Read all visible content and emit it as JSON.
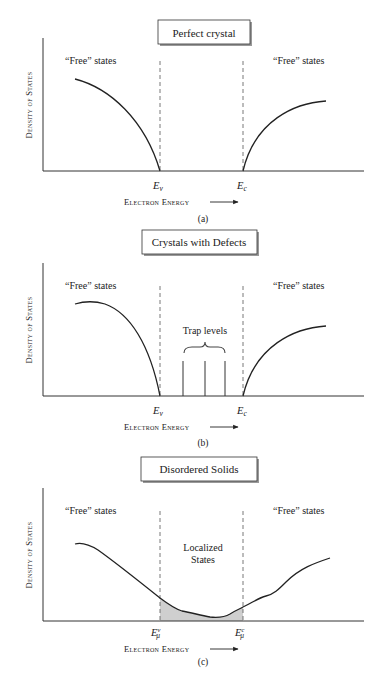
{
  "figure": {
    "panels": [
      {
        "id": "a",
        "title": "Perfect crystal",
        "caption": "(a)",
        "ylabel": "Density of States",
        "xlabel": "Electron Energy",
        "left_label": "“Free” states",
        "right_label": "“Free” states",
        "edge_left": {
          "base": "E",
          "sub": "v",
          "sup": ""
        },
        "edge_right": {
          "base": "E",
          "sub": "c",
          "sup": ""
        }
      },
      {
        "id": "b",
        "title": "Crystals with Defects",
        "caption": "(b)",
        "ylabel": "Density of States",
        "xlabel": "Electron Energy",
        "left_label": "“Free” states",
        "right_label": "“Free” states",
        "middle_label": "Trap levels",
        "edge_left": {
          "base": "E",
          "sub": "v",
          "sup": ""
        },
        "edge_right": {
          "base": "E",
          "sub": "c",
          "sup": ""
        }
      },
      {
        "id": "c",
        "title": "Disordered Solids",
        "caption": "(c)",
        "ylabel": "Density of States",
        "xlabel": "Electron Energy",
        "left_label": "“Free” states",
        "right_label": "“Free” states",
        "middle_label_line1": "Localized",
        "middle_label_line2": "States",
        "edge_left": {
          "base": "E",
          "sub": "μ",
          "sup": "v"
        },
        "edge_right": {
          "base": "E",
          "sub": "μ",
          "sup": "c"
        }
      }
    ],
    "colors": {
      "line": "#222222",
      "dashed": "#555555",
      "shade": "#cfcfcf",
      "box_shadow": "#999999"
    }
  }
}
